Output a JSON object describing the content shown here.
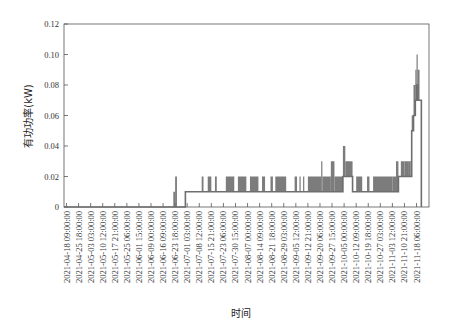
{
  "chart_data": {
    "type": "line",
    "title": "",
    "xlabel": "时间",
    "ylabel": "有功功率(kW)",
    "ylim": [
      0,
      0.12
    ],
    "yticks": [
      0,
      0.02,
      0.04,
      0.06,
      0.08,
      0.1,
      0.12
    ],
    "ytick_labels": [
      "0",
      "0.02",
      "0.04",
      "0.06",
      "0.08",
      "0.10",
      "0.12"
    ],
    "grid": false,
    "legend": null,
    "line_color": "#6e6e6e",
    "categories": [
      "2021-04-18 09:00:00",
      "2021-04-25 18:00:00",
      "2021-05-03 03:00:00",
      "2021-05-10 12:00:00",
      "2021-05-17 21:00:00",
      "2021-05-25 06:00:00",
      "2021-06-01 15:00:00",
      "2021-06-09 00:00:00",
      "2021-06-16 09:00:00",
      "2021-06-23 18:00:00",
      "2021-07-01 03:00:00",
      "2021-07-08 12:00:00",
      "2021-07-15 21:00:00",
      "2021-07-23 06:00:00",
      "2021-07-30 15:00:00",
      "2021-08-07 00:00:00",
      "2021-08-14 09:00:00",
      "2021-08-21 18:00:00",
      "2021-08-29 03:00:00",
      "2021-09-05 12:00:00",
      "2021-09-12 21:00:00",
      "2021-09-20 06:00:00",
      "2021-09-27 15:00:00",
      "2021-10-05 00:00:00",
      "2021-10-12 09:00:00",
      "2021-10-19 18:00:00",
      "2021-10-27 03:00:00",
      "2021-11-03 12:00:00",
      "2021-11-10 21:00:00",
      "2021-11-18 06:00:00"
    ],
    "series": [
      {
        "name": "有功功率",
        "description": "Approximate step levels read at fractional tick positions (0 = first tick, 29 = last tick)",
        "points": [
          {
            "x": 0.0,
            "y": 0,
            "y_max": 0
          },
          {
            "x": 8.8,
            "y": 0,
            "y_max": 0
          },
          {
            "x": 8.85,
            "y": 0,
            "y_max": 0.01
          },
          {
            "x": 9.0,
            "y": 0,
            "y_max": 0.02
          },
          {
            "x": 9.15,
            "y": 0,
            "y_max": 0
          },
          {
            "x": 9.8,
            "y": 0,
            "y_max": 0
          },
          {
            "x": 9.85,
            "y": 0.01,
            "y_max": 0.01
          },
          {
            "x": 11.2,
            "y": 0.01,
            "y_max": 0.02
          },
          {
            "x": 11.35,
            "y": 0.01,
            "y_max": 0.01
          },
          {
            "x": 11.7,
            "y": 0.01,
            "y_max": 0.02
          },
          {
            "x": 12.0,
            "y": 0.01,
            "y_max": 0.01
          },
          {
            "x": 12.3,
            "y": 0.01,
            "y_max": 0.02
          },
          {
            "x": 12.45,
            "y": 0.01,
            "y_max": 0.01
          },
          {
            "x": 13.2,
            "y": 0.01,
            "y_max": 0.02
          },
          {
            "x": 13.9,
            "y": 0.01,
            "y_max": 0.01
          },
          {
            "x": 14.2,
            "y": 0.01,
            "y_max": 0.02
          },
          {
            "x": 14.9,
            "y": 0.01,
            "y_max": 0.01
          },
          {
            "x": 15.2,
            "y": 0.01,
            "y_max": 0.02
          },
          {
            "x": 15.9,
            "y": 0.01,
            "y_max": 0.01
          },
          {
            "x": 16.2,
            "y": 0.01,
            "y_max": 0.02
          },
          {
            "x": 16.45,
            "y": 0.01,
            "y_max": 0.01
          },
          {
            "x": 16.9,
            "y": 0.01,
            "y_max": 0.02
          },
          {
            "x": 17.1,
            "y": 0.01,
            "y_max": 0.01
          },
          {
            "x": 17.3,
            "y": 0.01,
            "y_max": 0.02
          },
          {
            "x": 18.2,
            "y": 0.01,
            "y_max": 0.01
          },
          {
            "x": 18.9,
            "y": 0.01,
            "y_max": 0.02
          },
          {
            "x": 19.1,
            "y": 0.01,
            "y_max": 0.01
          },
          {
            "x": 19.3,
            "y": 0.01,
            "y_max": 0.02
          },
          {
            "x": 19.4,
            "y": 0.01,
            "y_max": 0.01
          },
          {
            "x": 19.6,
            "y": 0.01,
            "y_max": 0.02
          },
          {
            "x": 19.7,
            "y": 0.01,
            "y_max": 0.01
          },
          {
            "x": 20.0,
            "y": 0.01,
            "y_max": 0.02
          },
          {
            "x": 21.1,
            "y": 0.01,
            "y_max": 0.03
          },
          {
            "x": 21.2,
            "y": 0.01,
            "y_max": 0.02
          },
          {
            "x": 21.9,
            "y": 0.01,
            "y_max": 0.03
          },
          {
            "x": 22.2,
            "y": 0.01,
            "y_max": 0.02
          },
          {
            "x": 22.9,
            "y": 0.02,
            "y_max": 0.04
          },
          {
            "x": 23.1,
            "y": 0.02,
            "y_max": 0.03
          },
          {
            "x": 23.7,
            "y": 0.01,
            "y_max": 0.01
          },
          {
            "x": 24.0,
            "y": 0.01,
            "y_max": 0.02
          },
          {
            "x": 24.5,
            "y": 0.01,
            "y_max": 0.01
          },
          {
            "x": 24.9,
            "y": 0.01,
            "y_max": 0.02
          },
          {
            "x": 25.1,
            "y": 0.01,
            "y_max": 0.01
          },
          {
            "x": 25.4,
            "y": 0.01,
            "y_max": 0.02
          },
          {
            "x": 27.0,
            "y": 0.01,
            "y_max": 0.02
          },
          {
            "x": 27.3,
            "y": 0.01,
            "y_max": 0.03
          },
          {
            "x": 27.5,
            "y": 0.02,
            "y_max": 0.02
          },
          {
            "x": 27.7,
            "y": 0.02,
            "y_max": 0.03
          },
          {
            "x": 28.0,
            "y": 0.02,
            "y_max": 0.03
          },
          {
            "x": 28.3,
            "y": 0.02,
            "y_max": 0.03
          },
          {
            "x": 28.5,
            "y": 0.02,
            "y_max": 0.03
          },
          {
            "x": 28.6,
            "y": 0.05,
            "y_max": 0.06
          },
          {
            "x": 28.75,
            "y": 0.06,
            "y_max": 0.08
          },
          {
            "x": 28.9,
            "y": 0.07,
            "y_max": 0.09
          },
          {
            "x": 29.0,
            "y": 0.08,
            "y_max": 0.1
          },
          {
            "x": 29.1,
            "y": 0.07,
            "y_max": 0.09
          },
          {
            "x": 29.25,
            "y": 0.07,
            "y_max": 0.07
          },
          {
            "x": 29.4,
            "y": 0.0,
            "y_max": 0.0
          }
        ]
      }
    ]
  }
}
